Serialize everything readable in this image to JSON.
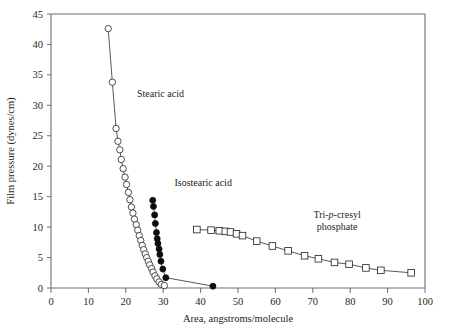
{
  "chart_data": {
    "type": "scatter",
    "title": "",
    "xlabel": "Area, angstroms/molecule",
    "ylabel": "Film pressure (dynes/cm)",
    "xlim": [
      0,
      100
    ],
    "ylim": [
      0,
      45
    ],
    "xticks": [
      0,
      10,
      20,
      30,
      40,
      50,
      60,
      70,
      80,
      90,
      100
    ],
    "yticks": [
      0,
      5,
      10,
      15,
      20,
      25,
      30,
      35,
      40,
      45
    ],
    "grid": false,
    "legend_position": "inline-annotations",
    "series": [
      {
        "name": "Stearic acid",
        "marker": "open-circle",
        "label_x": 23.0,
        "label_y": 31.3,
        "points": [
          [
            15.3,
            42.6
          ],
          [
            16.4,
            33.8
          ],
          [
            17.4,
            26.2
          ],
          [
            17.9,
            24.1
          ],
          [
            18.4,
            22.7
          ],
          [
            18.8,
            21.1
          ],
          [
            19.3,
            19.6
          ],
          [
            19.8,
            18.2
          ],
          [
            20.2,
            17.0
          ],
          [
            20.7,
            15.7
          ],
          [
            21.1,
            14.5
          ],
          [
            21.5,
            13.3
          ],
          [
            21.9,
            12.3
          ],
          [
            22.3,
            11.3
          ],
          [
            22.8,
            10.4
          ],
          [
            23.2,
            9.5
          ],
          [
            23.6,
            8.6
          ],
          [
            24.0,
            7.8
          ],
          [
            24.4,
            7.0
          ],
          [
            24.8,
            6.3
          ],
          [
            25.2,
            5.6
          ],
          [
            25.6,
            5.0
          ],
          [
            26.0,
            4.4
          ],
          [
            26.4,
            3.8
          ],
          [
            26.9,
            3.2
          ],
          [
            27.3,
            2.6
          ],
          [
            27.8,
            2.0
          ],
          [
            28.3,
            1.5
          ],
          [
            28.9,
            1.0
          ],
          [
            29.5,
            0.6
          ],
          [
            30.3,
            0.4
          ]
        ]
      },
      {
        "name": "Isostearic acid",
        "marker": "filled-circle",
        "label_x": 33.0,
        "label_y": 16.7,
        "points": [
          [
            27.2,
            14.4
          ],
          [
            27.4,
            13.4
          ],
          [
            27.7,
            12.0
          ],
          [
            27.9,
            10.6
          ],
          [
            28.2,
            9.1
          ],
          [
            28.4,
            8.1
          ],
          [
            28.6,
            7.3
          ],
          [
            28.9,
            6.4
          ],
          [
            29.1,
            5.5
          ],
          [
            29.4,
            4.4
          ],
          [
            29.9,
            3.1
          ],
          [
            30.7,
            1.7
          ],
          [
            43.3,
            0.3
          ]
        ]
      },
      {
        "name": "Tri-p-cresyl phosphate",
        "marker": "open-square",
        "label_x": 76.5,
        "label_y": 11.5,
        "points": [
          [
            39.0,
            9.6
          ],
          [
            42.8,
            9.5
          ],
          [
            45.0,
            9.4
          ],
          [
            46.6,
            9.3
          ],
          [
            48.0,
            9.2
          ],
          [
            49.6,
            8.9
          ],
          [
            51.2,
            8.6
          ],
          [
            55.0,
            7.7
          ],
          [
            59.2,
            6.9
          ],
          [
            63.4,
            6.1
          ],
          [
            67.8,
            5.3
          ],
          [
            71.5,
            4.8
          ],
          [
            75.8,
            4.2
          ],
          [
            79.7,
            3.9
          ],
          [
            84.2,
            3.3
          ],
          [
            88.2,
            2.9
          ],
          [
            96.3,
            2.5
          ]
        ]
      }
    ]
  },
  "labels": {
    "stearic_acid": "Stearic acid",
    "isostearic_acid": "Isostearic acid",
    "tricresyl_line1_pre": "Tri-",
    "tricresyl_line1_ital": "p",
    "tricresyl_line1_post": "-cresyl",
    "tricresyl_line2": "phosphate",
    "x_axis_title": "Area, angstroms/molecule",
    "y_axis_title": "Film pressure (dynes/cm)"
  },
  "colors": {
    "axis": "#6d6e71",
    "ink": "#231f20",
    "marker_fill_open": "#ffffff",
    "marker_fill_solid": "#0d0d0d",
    "background": "#ffffff"
  }
}
